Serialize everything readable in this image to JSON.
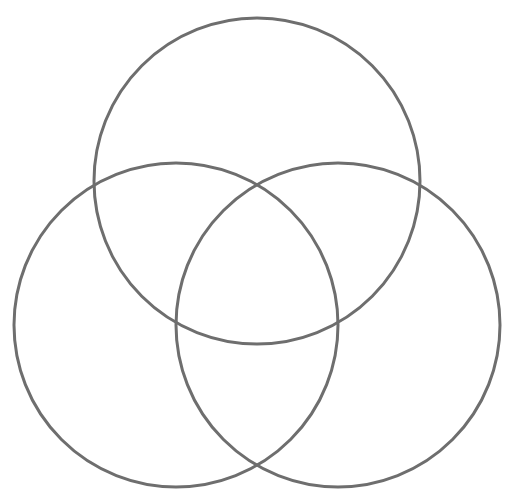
{
  "diagram": {
    "type": "venn",
    "sets_count": 3,
    "background": "#ffffff",
    "stroke_color": "#6e6e6e",
    "stroke_width": 3,
    "circles": [
      {
        "name": "top",
        "label": "",
        "cx": 257,
        "cy": 181,
        "r": 163
      },
      {
        "name": "left",
        "label": "",
        "cx": 176,
        "cy": 325,
        "r": 162
      },
      {
        "name": "right",
        "label": "",
        "cx": 338,
        "cy": 325,
        "r": 162
      }
    ],
    "region_labels": []
  }
}
